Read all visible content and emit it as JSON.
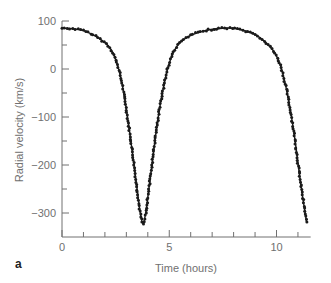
{
  "chart_data": {
    "type": "line",
    "title": "",
    "panel_label": "a",
    "xlabel": "Time (hours)",
    "ylabel": "Radial velocity (km/s)",
    "xlim": [
      0,
      11.5
    ],
    "ylim": [
      -350,
      100
    ],
    "x_ticks": [
      0,
      5,
      10
    ],
    "x_tick_labels": [
      "0",
      "5",
      "10"
    ],
    "x_minor_ticks": [
      1,
      2,
      3,
      4,
      6,
      7,
      8,
      9,
      11
    ],
    "y_ticks": [
      100,
      0,
      -100,
      -200,
      -300
    ],
    "y_tick_labels": [
      "100",
      "0",
      "−100",
      "−200",
      "−300"
    ],
    "y_minor_ticks": [
      50,
      -50,
      -150,
      -250
    ],
    "grid": false,
    "legend": null,
    "series": [
      {
        "name": "Radial velocity (fit + observations)",
        "style": "solid line with dot markers",
        "color": "#1a1a1a",
        "x": [
          0,
          0.5,
          1,
          1.5,
          2,
          2.3,
          2.5,
          2.7,
          2.9,
          3.1,
          3.3,
          3.5,
          3.65,
          3.77,
          3.9,
          4.05,
          4.25,
          4.45,
          4.7,
          4.95,
          5.2,
          5.5,
          6,
          6.5,
          7,
          7.5,
          8,
          8.5,
          9,
          9.5,
          9.9,
          10.2,
          10.45,
          10.7,
          10.9,
          11.1,
          11.3,
          11.4
        ],
        "values": [
          85,
          84,
          80,
          70,
          55,
          40,
          20,
          -10,
          -55,
          -115,
          -180,
          -250,
          -300,
          -322,
          -300,
          -250,
          -180,
          -110,
          -45,
          5,
          35,
          55,
          70,
          78,
          83,
          85,
          85,
          80,
          72,
          55,
          35,
          5,
          -40,
          -100,
          -160,
          -230,
          -290,
          -318
        ]
      }
    ],
    "annotations": {
      "minimum": {
        "x": 3.77,
        "y": -322
      },
      "maxima": [
        {
          "x": 0,
          "y": 85
        },
        {
          "x": 7.7,
          "y": 85
        }
      ]
    }
  }
}
